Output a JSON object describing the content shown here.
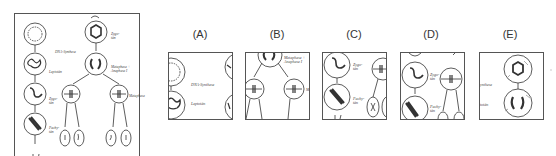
{
  "figure": {
    "left_column_labels": [
      "DNA-Synthese",
      "Leptotän",
      "Zygo-\ntän",
      "Pachy-\ntän"
    ],
    "right_column_labels": [
      "Zygo-\ntän",
      "Metaphase +\nAnaphase I",
      "Metaphase"
    ]
  },
  "options": [
    {
      "label": "(A)",
      "crop_labels": [
        "DNA-Synthese",
        "Leptotän"
      ]
    },
    {
      "label": "(B)",
      "crop_labels": [
        "Metaphase +\nAnaphase I",
        "Meta"
      ]
    },
    {
      "label": "(C)",
      "crop_labels": [
        "Zygo-\ntän",
        "Pachy-\ntän"
      ]
    },
    {
      "label": "(D)",
      "crop_labels": [
        "Zygo-\ntän",
        "Pachy-\ntän"
      ]
    },
    {
      "label": "(E)",
      "crop_labels": [
        "ynthese",
        "totän"
      ]
    }
  ],
  "colors": {
    "stroke": "#333333",
    "frame": "#555555",
    "text": "#333333"
  }
}
